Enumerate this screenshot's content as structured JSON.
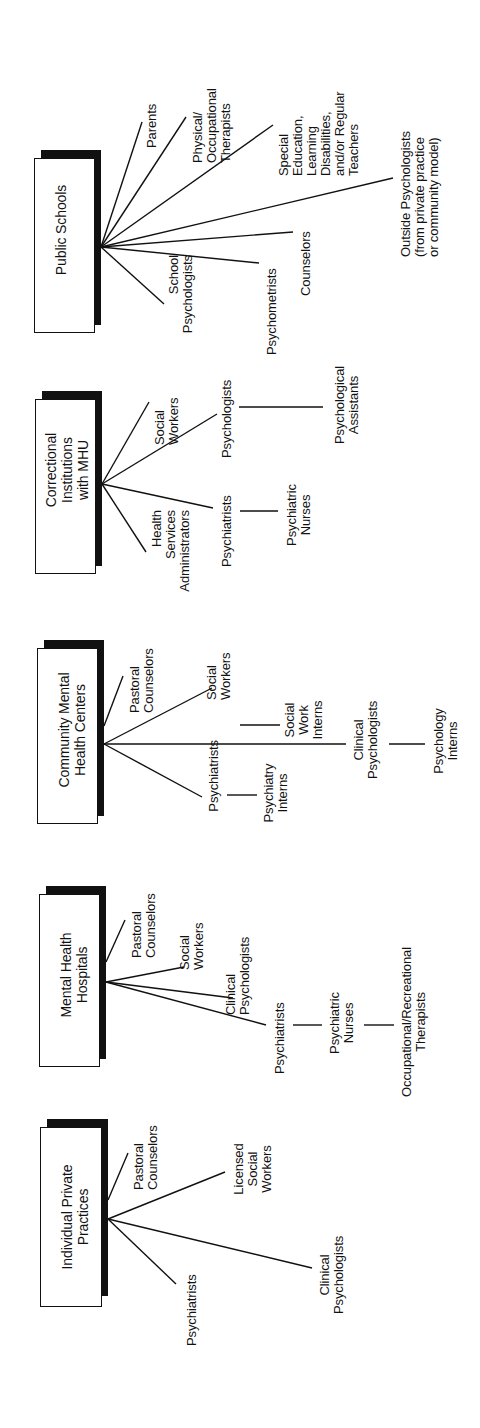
{
  "diagram": {
    "type": "organizational-roles",
    "orientation": "rotated-90-ccw",
    "colors": {
      "ink": "#111111",
      "background": "#ffffff"
    },
    "settings": [
      {
        "name": "Public Schools",
        "roles": [
          "Parents",
          "Physical/\nOccupational\nTherapists",
          "Special\nEducation,\nLearning\nDisabilities,\nand/or Regular\nTeachers",
          "Outside Psychologists\n(from private practice\nor community model)",
          "Counselors",
          "Psychometrists",
          "School\nPsychologists"
        ]
      },
      {
        "name": "Correctional\nInstitutions\nwith MHU",
        "roles": [
          "Social\nWorkers",
          "Psychologists",
          "Psychiatrists",
          "Health\nServices\nAdministrators"
        ],
        "sub_roles": [
          {
            "from": "Psychologists",
            "to": "Psychological\nAssistants"
          },
          {
            "from": "Psychiatrists",
            "to": "Psychiatric\nNurses"
          }
        ]
      },
      {
        "name": "Community Mental\nHealth Centers",
        "roles": [
          "Pastoral\nCounselors",
          "Social\nWorkers",
          "Clinical\nPsychologists",
          "Psychiatrists"
        ],
        "sub_roles": [
          {
            "from": "Social Workers",
            "to": "Social\nWork\nInterns"
          },
          {
            "from": "Clinical Psychologists",
            "to": "Psychology\nInterns"
          },
          {
            "from": "Psychiatrists",
            "to": "Psychiatry\nInterns"
          }
        ]
      },
      {
        "name": "Mental Health\nHospitals",
        "roles": [
          "Pastoral\nCounselors",
          "Social\nWorkers",
          "Clinical\nPsychologists",
          "Psychiatrists"
        ],
        "sub_roles": [
          {
            "from": "Psychiatrists",
            "to": "Psychiatric\nNurses"
          },
          {
            "from": "Psychiatric Nurses",
            "to": "Occupational/Recreational\nTherapists"
          }
        ]
      },
      {
        "name": "Individual Private\nPractices",
        "roles": [
          "Pastoral\nCounselors",
          "Licensed\nSocial\nWorkers",
          "Clinical\nPsychologists",
          "Psychiatrists"
        ]
      }
    ]
  }
}
